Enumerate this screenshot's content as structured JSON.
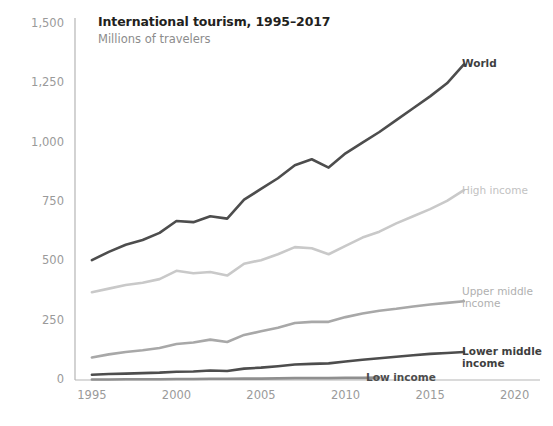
{
  "chart_data": {
    "type": "line",
    "title": "International tourism, 1995–2017",
    "subtitle": "Millions of travelers",
    "xlabel": "",
    "ylabel": "",
    "xlim": [
      1994,
      2021.5
    ],
    "ylim": [
      0,
      1500
    ],
    "yticks": [
      0,
      250,
      500,
      750,
      1000,
      1250,
      1500
    ],
    "ytick_labels": [
      "0",
      "250",
      "500",
      "750",
      "1,000",
      "1,250",
      "1,500"
    ],
    "xticks": [
      1995,
      2000,
      2005,
      2010,
      2015,
      2020
    ],
    "xtick_labels": [
      "1995",
      "2000",
      "2005",
      "2010",
      "2015",
      "2020"
    ],
    "grid": false,
    "legend_position": "right-inline",
    "series": [
      {
        "name": "World",
        "color": "#4d4d4d",
        "label": "World",
        "label_bold": true,
        "x": [
          1995,
          1996,
          1997,
          1998,
          1999,
          2000,
          2001,
          2002,
          2003,
          2004,
          2005,
          2006,
          2007,
          2008,
          2009,
          2010,
          2011,
          2012,
          2013,
          2014,
          2015,
          2016,
          2017
        ],
        "values": [
          505,
          540,
          570,
          590,
          620,
          670,
          665,
          690,
          680,
          760,
          805,
          850,
          905,
          930,
          895,
          955,
          1000,
          1045,
          1095,
          1145,
          1195,
          1250,
          1330
        ]
      },
      {
        "name": "High income",
        "color": "#c9c9c9",
        "label": "High income",
        "label_bold": false,
        "x": [
          1995,
          1996,
          1997,
          1998,
          1999,
          2000,
          2001,
          2002,
          2003,
          2004,
          2005,
          2006,
          2007,
          2008,
          2009,
          2010,
          2011,
          2012,
          2013,
          2014,
          2015,
          2016,
          2017
        ],
        "values": [
          370,
          385,
          400,
          410,
          425,
          460,
          450,
          455,
          440,
          490,
          505,
          530,
          560,
          555,
          530,
          565,
          600,
          625,
          660,
          690,
          720,
          755,
          800
        ]
      },
      {
        "name": "Upper middle income",
        "color": "#a8a8a8",
        "label": "Upper middle\nincome",
        "label_bold": false,
        "x": [
          1995,
          1996,
          1997,
          1998,
          1999,
          2000,
          2001,
          2002,
          2003,
          2004,
          2005,
          2006,
          2007,
          2008,
          2009,
          2010,
          2011,
          2012,
          2013,
          2014,
          2015,
          2016,
          2017
        ],
        "values": [
          95,
          108,
          118,
          125,
          135,
          152,
          158,
          170,
          160,
          190,
          205,
          220,
          240,
          245,
          245,
          265,
          280,
          292,
          300,
          310,
          318,
          325,
          332
        ]
      },
      {
        "name": "Lower middle income",
        "color": "#4d4d4d",
        "label": "Lower middle\nincome",
        "label_bold": true,
        "x": [
          1995,
          1996,
          1997,
          1998,
          1999,
          2000,
          2001,
          2002,
          2003,
          2004,
          2005,
          2006,
          2007,
          2008,
          2009,
          2010,
          2011,
          2012,
          2013,
          2014,
          2015,
          2016,
          2017
        ],
        "values": [
          22,
          25,
          27,
          29,
          31,
          35,
          36,
          40,
          38,
          48,
          52,
          58,
          65,
          68,
          70,
          78,
          85,
          92,
          98,
          104,
          110,
          114,
          118
        ]
      },
      {
        "name": "Low income",
        "color": "#8f8f8f",
        "label": "Low income",
        "label_bold": true,
        "x": [
          1995,
          1996,
          1997,
          1998,
          1999,
          2000,
          2001,
          2002,
          2003,
          2004,
          2005,
          2006,
          2007,
          2008,
          2009,
          2010,
          2011,
          2012
        ],
        "values": [
          2,
          2,
          3,
          3,
          3,
          4,
          4,
          5,
          5,
          6,
          6,
          7,
          8,
          8,
          8,
          9,
          9,
          10
        ]
      }
    ],
    "axis_color": "#b5b5b5",
    "tick_text_color": "#9a9a9a",
    "title_color": "#231f20",
    "subtitle_color": "#8c8c8c"
  },
  "series_labels": [
    {
      "text": "World",
      "x": 462,
      "y": 57,
      "color": "#3f3f3f",
      "bold": true
    },
    {
      "text": "High income",
      "x": 462,
      "y": 184,
      "color": "#c2c2c2",
      "bold": false
    },
    {
      "text": "Upper middle\nincome",
      "x": 462,
      "y": 285,
      "color": "#b0b0b0",
      "bold": false
    },
    {
      "text": "Lower middle\nincome",
      "x": 462,
      "y": 345,
      "color": "#3f3f3f",
      "bold": true
    },
    {
      "text": "Low income",
      "x": 366,
      "y": 371,
      "color": "#4d4d4d",
      "bold": true
    }
  ]
}
